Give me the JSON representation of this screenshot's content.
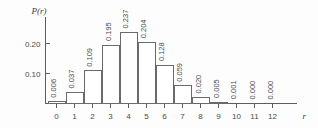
{
  "chart_data": {
    "type": "bar",
    "title": "",
    "subtitle": "",
    "xlabel": "r",
    "ylabel": "P(r)",
    "categories": [
      "0",
      "1",
      "2",
      "3",
      "4",
      "5",
      "6",
      "7",
      "8",
      "9",
      "10",
      "11",
      "12"
    ],
    "values": [
      0.006,
      0.037,
      0.109,
      0.195,
      0.237,
      0.204,
      0.128,
      0.059,
      0.02,
      0.005,
      0.001,
      0.0,
      0.0
    ],
    "value_labels": [
      "0.006",
      "0.037",
      "0.109",
      "0.195",
      "0.237",
      "0.204",
      "0.128",
      "0.059",
      "0.020",
      "0.005",
      "0.001",
      "0.000",
      "0.000"
    ],
    "ytick_values": [
      0.1,
      0.2
    ],
    "ytick_labels": [
      "0.10",
      "0.20"
    ],
    "xlim": [
      -0.5,
      12.5
    ],
    "ylim": [
      0,
      0.26
    ],
    "grid": false,
    "legend": null,
    "value_label_rotation": -90,
    "bar_fill": "#ffffff",
    "bar_stroke": "#6a6a6a",
    "axis_color": "#5d5d5d",
    "text_color": "#4a4a4a",
    "background": "#fdfdfd"
  }
}
